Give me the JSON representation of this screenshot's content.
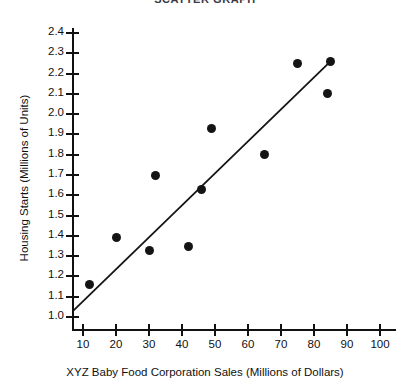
{
  "chart_data": {
    "type": "scatter",
    "title": "SCATTER GRAPH",
    "xlabel": "XYZ Baby Food Corporation Sales (Millions of Dollars)",
    "ylabel": "Housing Starts (Millions of Units)",
    "xlim": [
      0,
      105
    ],
    "ylim": [
      1.0,
      2.45
    ],
    "grid": false,
    "legend": null,
    "xticks": [
      10,
      20,
      30,
      40,
      50,
      60,
      70,
      80,
      90,
      100
    ],
    "xtick_labels": [
      "10",
      "20",
      "30",
      "40",
      "50",
      "60",
      "70",
      "80",
      "90",
      "100"
    ],
    "yticks": [
      1.0,
      1.1,
      1.2,
      1.3,
      1.4,
      1.5,
      1.6,
      1.7,
      1.8,
      1.9,
      2.0,
      2.1,
      2.2,
      2.3,
      2.4
    ],
    "ytick_labels": [
      "1.0",
      "1.1",
      "1.2",
      "1.3",
      "1.4",
      "1.5",
      "1.6",
      "1.7",
      "1.8",
      "1.9",
      "2.0",
      "2.1",
      "2.2",
      "2.3",
      "2.4"
    ],
    "marker_color": "#141414",
    "line_color": "#141414",
    "points": [
      {
        "x": 12,
        "y": 1.16
      },
      {
        "x": 20,
        "y": 1.39
      },
      {
        "x": 30,
        "y": 1.33
      },
      {
        "x": 32,
        "y": 1.7
      },
      {
        "x": 42,
        "y": 1.35
      },
      {
        "x": 46,
        "y": 1.63
      },
      {
        "x": 49,
        "y": 1.93
      },
      {
        "x": 65,
        "y": 1.8
      },
      {
        "x": 75,
        "y": 2.25
      },
      {
        "x": 84,
        "y": 2.1
      },
      {
        "x": 85,
        "y": 2.26
      }
    ],
    "trend_line": {
      "label": "line of best fit",
      "x_start": 7,
      "y_start": 1.03,
      "x_end": 85,
      "y_end": 2.26
    }
  }
}
